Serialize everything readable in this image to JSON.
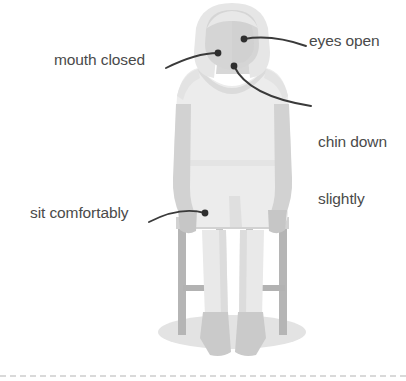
{
  "figure": {
    "colors": {
      "background": "#ffffff",
      "body_light": "#ebebeb",
      "body_mid": "#dedede",
      "body_shadow": "#c9c9c9",
      "hair": "#e4e4e4",
      "face": "#d6d6d6",
      "chair": "#b3b3b3",
      "floor_shadow": "#e0e0e0",
      "leader_line": "#3a3a3a",
      "label_text": "#4a4a4a",
      "baseline_rule": "#d9d9d9"
    }
  },
  "callouts": [
    {
      "id": "eyes-open",
      "label": "eyes open",
      "target": "eyes",
      "dot": {
        "x": 243,
        "y": 39
      },
      "text_anchor": {
        "x": 309,
        "y": 46
      }
    },
    {
      "id": "mouth-closed",
      "label": "mouth closed",
      "target": "mouth",
      "dot": {
        "x": 219,
        "y": 52
      },
      "text_anchor": {
        "x": 163,
        "y": 68
      }
    },
    {
      "id": "chin-down",
      "label": "chin down\nslightly",
      "label_line1": "chin down",
      "label_line2": "slightly",
      "target": "chin",
      "dot": {
        "x": 233,
        "y": 65
      },
      "text_anchor": {
        "x": 313,
        "y": 106
      }
    },
    {
      "id": "sit-comfortably",
      "label": "sit comfortably",
      "target": "lap",
      "dot": {
        "x": 206,
        "y": 212
      },
      "text_anchor": {
        "x": 148,
        "y": 222
      }
    }
  ],
  "decor": {
    "baseline_rule": "dashed"
  }
}
